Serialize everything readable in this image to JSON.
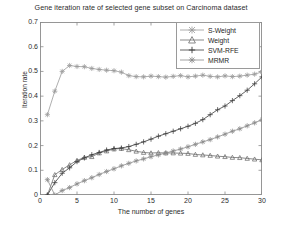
{
  "chart_data": {
    "type": "line",
    "title": "Gene iteration rate of selected gene subset on Carcinoma dataset",
    "xlabel": "The number of genes",
    "ylabel": "Iteration rate",
    "xlim": [
      0,
      30
    ],
    "ylim": [
      0,
      0.7
    ],
    "xticks": [
      0,
      5,
      10,
      15,
      20,
      25,
      30
    ],
    "xtick_labels": [
      "0",
      "5",
      "10",
      "15",
      "20",
      "25",
      "30"
    ],
    "yticks": [
      0,
      0.1,
      0.2,
      0.3,
      0.4,
      0.5,
      0.6,
      0.7
    ],
    "ytick_labels": [
      "0",
      "0.1",
      "0.2",
      "0.3",
      "0.4",
      "0.5",
      "0.6",
      "0.7"
    ],
    "grid": false,
    "legend_position": "upper right",
    "x": [
      1,
      2,
      3,
      4,
      5,
      6,
      7,
      8,
      9,
      10,
      11,
      12,
      13,
      14,
      15,
      16,
      17,
      18,
      19,
      20,
      21,
      22,
      23,
      24,
      25,
      26,
      27,
      28,
      29,
      30
    ],
    "series": [
      {
        "name": "S-Weight",
        "marker": "hexagram",
        "color": "#9a9a9a",
        "values": [
          0.325,
          0.42,
          0.5,
          0.524,
          0.52,
          0.519,
          0.512,
          0.508,
          0.505,
          0.503,
          0.497,
          0.483,
          0.479,
          0.478,
          0.481,
          0.479,
          0.477,
          0.48,
          0.483,
          0.478,
          0.481,
          0.485,
          0.48,
          0.478,
          0.482,
          0.479,
          0.481,
          0.485,
          0.489,
          0.498
        ]
      },
      {
        "name": "Weight",
        "marker": "triangle",
        "color": "#6d6d6d",
        "values": [
          0.0,
          0.082,
          0.103,
          0.122,
          0.14,
          0.152,
          0.155,
          0.17,
          0.178,
          0.186,
          0.188,
          0.183,
          0.177,
          0.172,
          0.17,
          0.171,
          0.17,
          0.17,
          0.169,
          0.168,
          0.164,
          0.162,
          0.16,
          0.157,
          0.155,
          0.152,
          0.151,
          0.148,
          0.145,
          0.142
        ]
      },
      {
        "name": "SVM-RFE",
        "marker": "plus",
        "color": "#3c3c3c",
        "values": [
          0.0,
          0.05,
          0.088,
          0.11,
          0.135,
          0.15,
          0.163,
          0.172,
          0.182,
          0.188,
          0.19,
          0.196,
          0.205,
          0.215,
          0.226,
          0.238,
          0.248,
          0.258,
          0.268,
          0.278,
          0.29,
          0.305,
          0.325,
          0.345,
          0.36,
          0.382,
          0.402,
          0.424,
          0.45,
          0.478
        ]
      },
      {
        "name": "MRMR",
        "marker": "star",
        "color": "#8a8a8a",
        "values": [
          0.062,
          0.0,
          0.018,
          0.03,
          0.045,
          0.058,
          0.07,
          0.083,
          0.095,
          0.106,
          0.118,
          0.128,
          0.138,
          0.146,
          0.155,
          0.162,
          0.17,
          0.178,
          0.186,
          0.195,
          0.205,
          0.215,
          0.224,
          0.235,
          0.246,
          0.258,
          0.268,
          0.28,
          0.292,
          0.305
        ]
      }
    ]
  }
}
